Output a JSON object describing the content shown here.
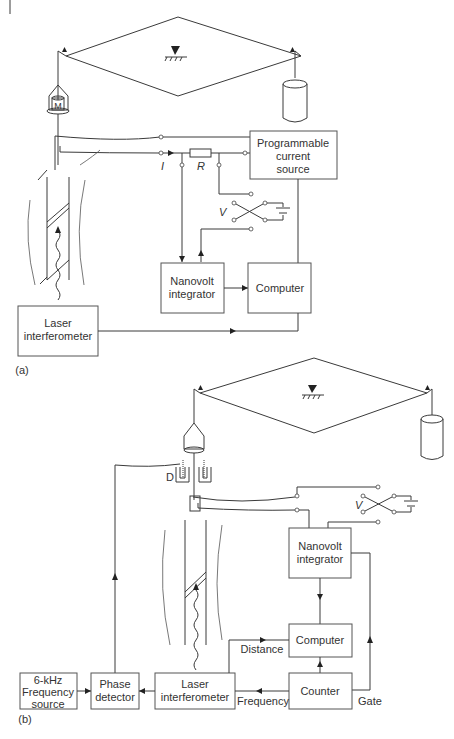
{
  "figure": {
    "panel_a": {
      "caption": "(a)",
      "boxes": {
        "current_source": [
          "Programmable",
          "current",
          "source"
        ],
        "nanovolt": [
          "Nanovolt",
          "integrator"
        ],
        "computer": "Computer",
        "laser": [
          "Laser",
          "interferometer"
        ]
      },
      "symbols": {
        "current": "I",
        "resistor": "R",
        "voltage": "V",
        "mass": "M"
      }
    },
    "panel_b": {
      "caption": "(b)",
      "boxes": {
        "nanovolt": [
          "Nanovolt",
          "integrator"
        ],
        "computer": "Computer",
        "counter": "Counter",
        "laser": [
          "Laser",
          "interferometer"
        ],
        "phase": [
          "Phase",
          "detector"
        ],
        "freq_source": [
          "6-kHz",
          "Frequency",
          "source"
        ]
      },
      "signals": {
        "distance": "Distance",
        "frequency": "Frequency",
        "gate": "Gate"
      },
      "symbols": {
        "voltage": "V",
        "damper": "D"
      }
    }
  }
}
